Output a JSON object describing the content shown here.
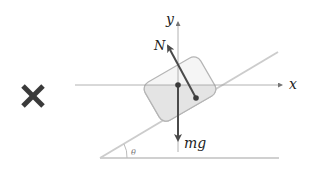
{
  "diagram": {
    "mark": {
      "symbol": "cross",
      "color": "#3a3a3a"
    },
    "labels": {
      "x_axis": "x",
      "y_axis": "y",
      "normal_force": "N",
      "weight": "mg",
      "angle": "θ"
    },
    "colors": {
      "axis": "#9a9a9a",
      "incline": "#c8c8c8",
      "block_stroke": "#b0b0b0",
      "block_fill": "#f4f4f4",
      "block_shade": "#e6e6e6",
      "vector": "#4a4a4a"
    }
  }
}
